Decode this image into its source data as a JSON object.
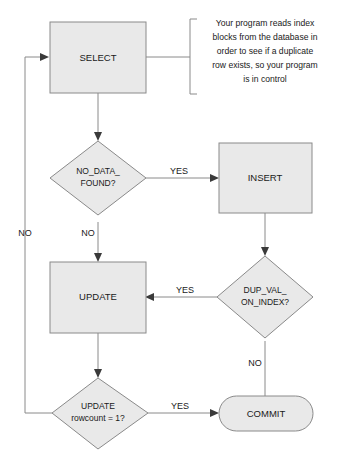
{
  "diagram": {
    "colors": {
      "shape_fill": "#e9e9e9",
      "shape_stroke": "#8a8a8a",
      "connector": "#8a8a8a",
      "arrow": "#3a3a3a",
      "text": "#1a1a1a",
      "background": "#ffffff"
    },
    "nodes": {
      "select": {
        "label": "SELECT",
        "shape": "process"
      },
      "no_data_found": {
        "label_line1": "NO_DATA_",
        "label_line2": "FOUND?",
        "shape": "decision"
      },
      "insert": {
        "label": "INSERT",
        "shape": "process"
      },
      "dup_val_on_index": {
        "label_line1": "DUP_VAL_",
        "label_line2": "ON_INDEX?",
        "shape": "decision"
      },
      "update": {
        "label": "UPDATE",
        "shape": "process"
      },
      "update_rowcount": {
        "label_line1": "UPDATE",
        "label_line2": "rowcount = 1?",
        "shape": "decision"
      },
      "commit": {
        "label": "COMMIT",
        "shape": "terminator"
      }
    },
    "edge_labels": {
      "no_data_yes": "YES",
      "no_data_no": "NO",
      "dup_val_yes": "YES",
      "dup_val_no": "NO",
      "rowcount_yes": "YES",
      "rowcount_no": "NO"
    },
    "note": {
      "lines": [
        "Your program reads index",
        "blocks from the database in",
        "order to see if a duplicate",
        "row exists, so your program",
        "is in control"
      ]
    }
  }
}
